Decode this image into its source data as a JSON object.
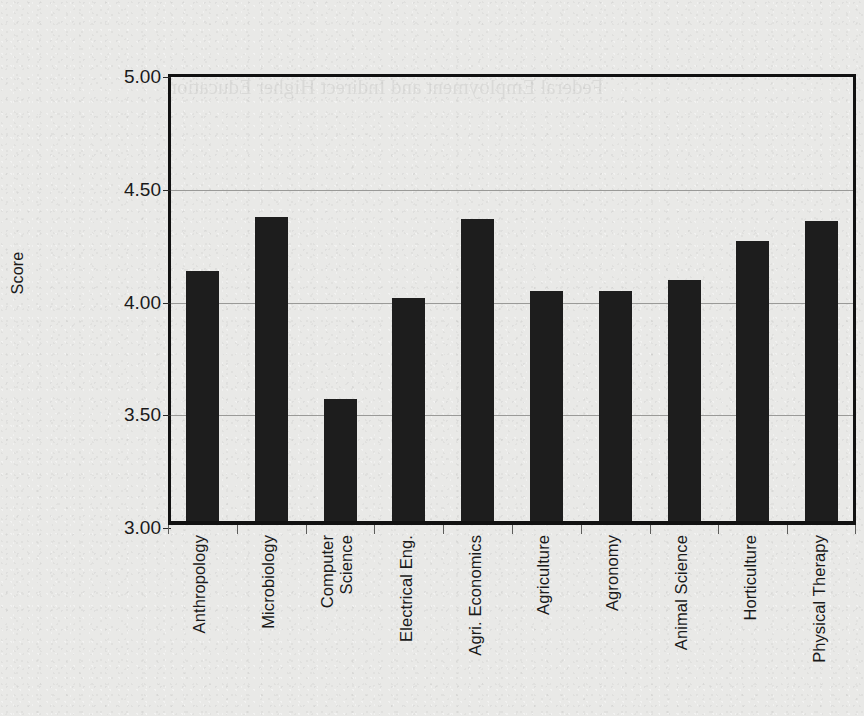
{
  "chart_data": {
    "type": "bar",
    "title": "",
    "xlabel": "",
    "ylabel": "Score",
    "categories": [
      "Anthropology",
      "Microbiology",
      "Computer\nScience",
      "Electrical Eng.",
      "Agri. Economics",
      "Agriculture",
      "Agronomy",
      "Animal Science",
      "Horticulture",
      "Physical Therapy"
    ],
    "values": [
      4.11,
      4.35,
      3.54,
      3.99,
      4.34,
      4.02,
      4.02,
      4.07,
      4.24,
      4.33
    ],
    "ylim": [
      3.0,
      5.0
    ],
    "yticks": [
      "3.00",
      "3.50",
      "4.00",
      "4.50",
      "5.00"
    ],
    "ytick_values": [
      3.0,
      3.5,
      4.0,
      4.5,
      5.0
    ],
    "gridlines": [
      3.5,
      4.0,
      4.5
    ],
    "grid": true,
    "legend": "none",
    "bar_color": "#1d1d1d",
    "background_color": "#e9e9e7",
    "axis_color": "#111111",
    "gridline_color": "#9a9a98"
  },
  "figure": {
    "paper_background": "#e9e9e7",
    "bleed_through_text": "Federal Employment\nand Indirect\nHigher Education"
  }
}
